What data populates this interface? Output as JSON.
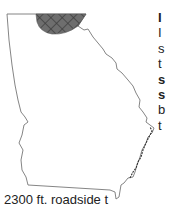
{
  "map": {
    "region": "Georgia (US state)",
    "highlighted_area": "north Georgia mountains",
    "colors": {
      "outline": "#777777",
      "highlight_fill": "#6e6e6e",
      "hatch": "#3c3c3c",
      "background": "#ffffff"
    }
  },
  "side_text": {
    "lines": [
      {
        "text": "I",
        "bold": true
      },
      {
        "text": "I",
        "bold": false
      },
      {
        "text": "s",
        "bold": false
      },
      {
        "text": "t",
        "bold": false
      },
      {
        "text": "s",
        "bold": true
      },
      {
        "text": "s",
        "bold": true
      },
      {
        "text": "b",
        "bold": false
      },
      {
        "text": "t",
        "bold": false
      }
    ]
  },
  "bottom_text": "2300 ft. roadside t"
}
